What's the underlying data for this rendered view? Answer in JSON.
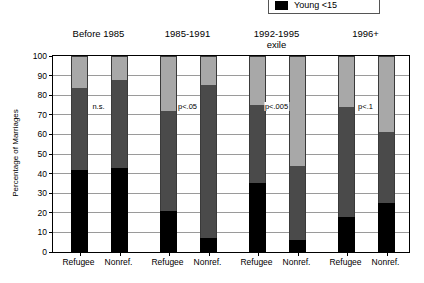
{
  "legend": {
    "items": [
      {
        "label": "Young <15",
        "color": "#000000",
        "icon": "legend-swatch-icon"
      }
    ]
  },
  "chart_data": {
    "type": "bar",
    "subtype": "stacked-bar",
    "title": "",
    "xlabel": "",
    "ylabel": "Percentage of Marriages",
    "ylim": [
      0,
      100
    ],
    "yticks": [
      0,
      10,
      20,
      30,
      40,
      50,
      60,
      70,
      80,
      90,
      100
    ],
    "ytick_labels": [
      "0",
      "10",
      "20",
      "30",
      "40",
      "50",
      "60",
      "70",
      "80",
      "90",
      "100"
    ],
    "grid": true,
    "legend_position": "top-right",
    "series": [
      {
        "name": "Young <15",
        "color": "#000000"
      },
      {
        "name": "Middle",
        "color": "#4a4a4a"
      },
      {
        "name": "Older",
        "color": "#a8a8a8"
      }
    ],
    "group_labels": [
      "Before 1985",
      "1985-1991",
      "1992-1995 exile",
      "1996+"
    ],
    "groups": [
      {
        "header_line1": "Before 1985",
        "header_line2": "",
        "significance": "n.s.",
        "bars": [
          {
            "label": "Refugee",
            "young": 42,
            "middle": 41.5,
            "older": 16.5
          },
          {
            "label": "Nonref.",
            "young": 43,
            "middle": 45,
            "older": 12
          }
        ]
      },
      {
        "header_line1": "1985-1991",
        "header_line2": "",
        "significance": "p<.05",
        "bars": [
          {
            "label": "Refugee",
            "young": 21,
            "middle": 51,
            "older": 28
          },
          {
            "label": "Nonref.",
            "young": 7,
            "middle": 78,
            "older": 15
          }
        ]
      },
      {
        "header_line1": "1992-1995",
        "header_line2": "exile",
        "significance": "p<.005",
        "bars": [
          {
            "label": "Refugee",
            "young": 35,
            "middle": 40,
            "older": 25
          },
          {
            "label": "Nonref.",
            "young": 6,
            "middle": 38,
            "older": 56
          }
        ]
      },
      {
        "header_line1": "1996+",
        "header_line2": "",
        "significance": "p<.1",
        "bars": [
          {
            "label": "Refugee",
            "young": 18,
            "middle": 56,
            "older": 26
          },
          {
            "label": "Nonref.",
            "young": 25,
            "middle": 36,
            "older": 39
          }
        ]
      }
    ]
  }
}
